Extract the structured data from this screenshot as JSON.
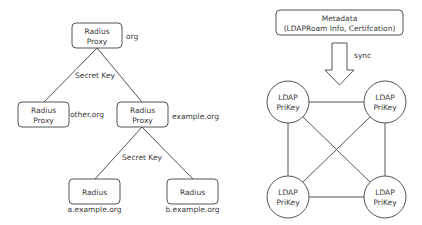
{
  "left_diagram": {
    "nodes": [
      {
        "id": "root",
        "line1": "Radius",
        "line2": "Proxy",
        "domain": "org"
      },
      {
        "id": "other",
        "line1": "Radius",
        "line2": "Proxy",
        "domain": "other.org"
      },
      {
        "id": "example",
        "line1": "Radius",
        "line2": "Proxy",
        "domain": "example.org"
      },
      {
        "id": "a",
        "line1": "Radius",
        "domain": "a.example.org"
      },
      {
        "id": "b",
        "line1": "Radius",
        "domain": "b.example.org"
      }
    ],
    "edge_labels": {
      "top": "Secret Key",
      "bottom": "Secret Key"
    }
  },
  "right_diagram": {
    "metadata": {
      "line1": "Metadata",
      "line2": "(LDAPRoam Info, Certifcation)"
    },
    "arrow_label": "sync",
    "nodes": [
      {
        "id": "tl",
        "line1": "LDAP",
        "line2": "PriKey"
      },
      {
        "id": "tr",
        "line1": "LDAP",
        "line2": "PriKey"
      },
      {
        "id": "bl",
        "line1": "LDAP",
        "line2": "PriKey"
      },
      {
        "id": "br",
        "line1": "LDAP",
        "line2": "PriKey"
      }
    ]
  },
  "colors": {
    "stroke": "#555555",
    "text": "#3a3a3a",
    "background": "#ffffff"
  }
}
